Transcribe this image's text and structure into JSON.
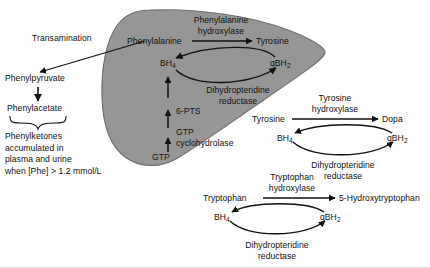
{
  "figure": {
    "background_color": "#ffffff",
    "blob_fill": "#969696",
    "blob_stroke": "#6e6e6e",
    "text_color": "#111111"
  },
  "liver_compartment": {
    "name": "hepatic compartment",
    "metabolites": {
      "phenylalanine": "Phenylalanine",
      "tyrosine": "Tyrosine",
      "bh4": "BH",
      "bh4_sub": "4",
      "qbh2": "qBH",
      "qbh2_sub": "2",
      "gtp": "GTP"
    },
    "enzymes": {
      "phenylalanine_hydroxylase_line1": "Phenylalanine",
      "phenylalanine_hydroxylase_line2": "hydroxylase",
      "dihydropteridine_reductase_line1": "Dihydropteridine",
      "dihydropteridine_reductase_line2": "reductase",
      "six_pts": "6-PTS",
      "gtp_cyclohydrolase_line1": "GTP",
      "gtp_cyclohydrolase_line2": "cyclohydrolase"
    }
  },
  "phenylketone_branch": {
    "transamination_label": "Transamination",
    "phenylpyruvate": "Phenylpyruvate",
    "phenylacetate": "Phenylacetate",
    "note_line1": "Phenylketones",
    "note_line2": "accumulated in",
    "note_line3": "plasma and urine",
    "note_line4": "when [Phe] > 1.2 mmol/L"
  },
  "tyrosine_cycle": {
    "substrate": "Tyrosine",
    "product": "Dopa",
    "bh4": "BH",
    "bh4_sub": "4",
    "qbh2": "qBH",
    "qbh2_sub": "2",
    "enzyme_line1": "Tyrosine",
    "enzyme_line2": "hydroxylase",
    "reductase_line1": "Dihydropteridine",
    "reductase_line2": "reductase"
  },
  "tryptophan_cycle": {
    "substrate": "Tryptophan",
    "product": "5-Hydroxytryptophan",
    "bh4": "BH",
    "bh4_sub": "4",
    "qbh2": "qBH",
    "qbh2_sub": "2",
    "enzyme_line1": "Tryptophan",
    "enzyme_line2": "hydroxylase",
    "reductase_line1": "Dihydropteridine",
    "reductase_line2": "reductase"
  }
}
